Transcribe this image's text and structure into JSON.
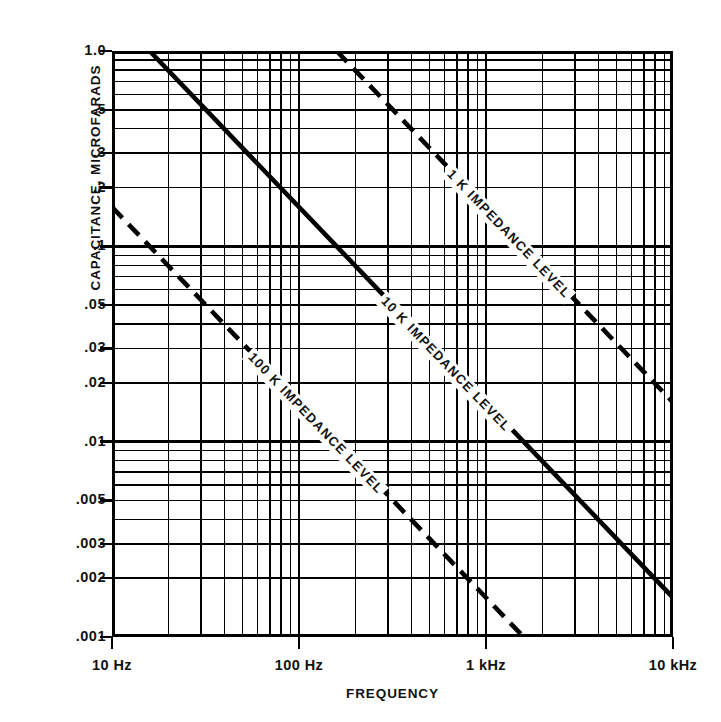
{
  "chart_data": {
    "type": "line",
    "title": "",
    "xlabel": "FREQUENCY",
    "ylabel": "CAPACITANCE, MICROFARADS",
    "xscale": "log",
    "yscale": "log",
    "xlim": [
      10,
      10000
    ],
    "ylim": [
      0.001,
      1.0
    ],
    "grid": true,
    "minor_grid": true,
    "legend_position": "inline-on-curve",
    "xticks": [
      {
        "value": 10,
        "label": "10 Hz"
      },
      {
        "value": 100,
        "label": "100 Hz"
      },
      {
        "value": 1000,
        "label": "1 kHz"
      },
      {
        "value": 10000,
        "label": "10 kHz"
      }
    ],
    "yticks": [
      {
        "value": 1.0,
        "label": "1.0"
      },
      {
        "value": 0.5,
        "label": ".5"
      },
      {
        "value": 0.3,
        "label": ".3"
      },
      {
        "value": 0.2,
        "label": ".2"
      },
      {
        "value": 0.1,
        "label": ".1"
      },
      {
        "value": 0.05,
        "label": ".05"
      },
      {
        "value": 0.03,
        "label": ".03"
      },
      {
        "value": 0.02,
        "label": ".02"
      },
      {
        "value": 0.01,
        "label": ".01"
      },
      {
        "value": 0.005,
        "label": ".005"
      },
      {
        "value": 0.003,
        "label": ".003"
      },
      {
        "value": 0.002,
        "label": ".002"
      },
      {
        "value": 0.001,
        "label": ".001"
      }
    ],
    "series": [
      {
        "name": "1 K IMPEDANCE LEVEL",
        "annotation": "1 K  IMPEDANCE LEVEL",
        "impedance_ohms": 1000,
        "style": "dashed",
        "color": "#000000",
        "x": [
          159,
          10000
        ],
        "y": [
          1.0,
          0.0159
        ],
        "points": [
          {
            "f": 159,
            "c": 1.0
          },
          {
            "f": 1000,
            "c": 0.159
          },
          {
            "f": 10000,
            "c": 0.0159
          }
        ]
      },
      {
        "name": "10 K IMPEDANCE LEVEL",
        "annotation": "10 K  IMPEDANCE LEVEL",
        "impedance_ohms": 10000,
        "style": "solid",
        "color": "#000000",
        "x": [
          15.9,
          10000
        ],
        "y": [
          1.0,
          0.00159
        ],
        "points": [
          {
            "f": 15.9,
            "c": 1.0
          },
          {
            "f": 100,
            "c": 0.159
          },
          {
            "f": 1000,
            "c": 0.0159
          },
          {
            "f": 10000,
            "c": 0.00159
          }
        ]
      },
      {
        "name": "100 K IMPEDANCE LEVEL",
        "annotation": "100 K  IMPEDANCE LEVEL",
        "impedance_ohms": 100000,
        "style": "dashed",
        "color": "#000000",
        "x": [
          10,
          1590
        ],
        "y": [
          0.159,
          0.001
        ],
        "points": [
          {
            "f": 10,
            "c": 0.159
          },
          {
            "f": 100,
            "c": 0.0159
          },
          {
            "f": 1000,
            "c": 0.00159
          },
          {
            "f": 1590,
            "c": 0.001
          }
        ]
      }
    ]
  },
  "axis": {
    "x_title": "FREQUENCY",
    "y_title": "CAPACITANCE, MICROFARADS"
  }
}
